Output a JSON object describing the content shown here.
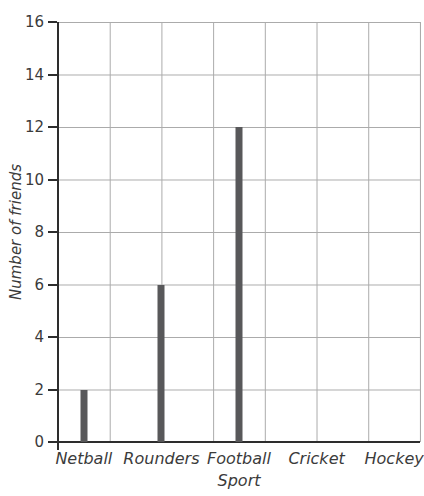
{
  "chart_data": {
    "type": "bar",
    "title": "",
    "categories": [
      "Netball",
      "Rounders",
      "Football",
      "Cricket",
      "Hockey"
    ],
    "values": [
      2,
      6,
      12,
      0,
      0
    ],
    "xlabel": "Sport",
    "ylabel": "Number of friends",
    "ylim": [
      0,
      16
    ],
    "yticks": [
      0,
      2,
      4,
      6,
      8,
      10,
      12,
      14,
      16
    ],
    "grid": {
      "style": "square graph paper",
      "columns": 7,
      "rows": 8,
      "visible": true
    },
    "legend_position": "none",
    "bar_style": "thin vertical bars",
    "colors": {
      "bar": "#58585a",
      "axis": "#2d2d2d",
      "gridline": "#ababab",
      "text": "#3b3b3b",
      "background": "#ffffff"
    }
  }
}
